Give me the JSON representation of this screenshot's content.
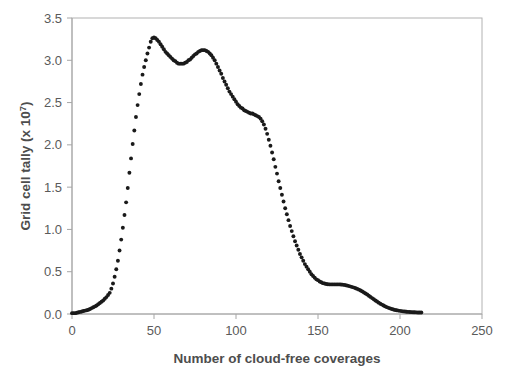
{
  "chart_data": {
    "type": "scatter",
    "title": "",
    "xlabel": "Number of cloud-free coverages",
    "ylabel": "Grid cell tally (x 10⁷)",
    "ylabel_base": "Grid cell tally (x 10",
    "ylabel_exp": "7",
    "ylabel_close": ")",
    "xlim": [
      0,
      250
    ],
    "ylim": [
      0.0,
      3.5
    ],
    "xticks": [
      0,
      50,
      100,
      150,
      200,
      250
    ],
    "xtick_labels": [
      "0",
      "50",
      "100",
      "150",
      "200",
      "250"
    ],
    "yticks": [
      0.0,
      0.5,
      1.0,
      1.5,
      2.0,
      2.5,
      3.0,
      3.5
    ],
    "ytick_labels": [
      "0.0",
      "0.5",
      "1.0",
      "1.5",
      "2.0",
      "2.5",
      "3.0",
      "3.5"
    ],
    "grid": false,
    "legend": "none",
    "marker": "circle",
    "marker_color": "#1a1a1a",
    "marker_size_px": 3.0,
    "plot_border_color": "#b0b0b0",
    "axis_color": "#a6a6a6",
    "tick_label_color": "#5a5a5a",
    "axis_title_color": "#4d4d4d",
    "x": [
      0,
      1,
      2,
      3,
      4,
      5,
      6,
      7,
      8,
      9,
      10,
      11,
      12,
      13,
      14,
      15,
      16,
      17,
      18,
      19,
      20,
      21,
      22,
      23,
      24,
      25,
      26,
      27,
      28,
      29,
      30,
      31,
      32,
      33,
      34,
      35,
      36,
      37,
      38,
      39,
      40,
      41,
      42,
      43,
      44,
      45,
      46,
      47,
      48,
      49,
      50,
      51,
      52,
      53,
      54,
      55,
      56,
      57,
      58,
      59,
      60,
      61,
      62,
      63,
      64,
      65,
      66,
      67,
      68,
      69,
      70,
      71,
      72,
      73,
      74,
      75,
      76,
      77,
      78,
      79,
      80,
      81,
      82,
      83,
      84,
      85,
      86,
      87,
      88,
      89,
      90,
      91,
      92,
      93,
      94,
      95,
      96,
      97,
      98,
      99,
      100,
      101,
      102,
      103,
      104,
      105,
      106,
      107,
      108,
      109,
      110,
      111,
      112,
      113,
      114,
      115,
      116,
      117,
      118,
      119,
      120,
      121,
      122,
      123,
      124,
      125,
      126,
      127,
      128,
      129,
      130,
      131,
      132,
      133,
      134,
      135,
      136,
      137,
      138,
      139,
      140,
      141,
      142,
      143,
      144,
      145,
      146,
      147,
      148,
      149,
      150,
      151,
      152,
      153,
      154,
      155,
      156,
      157,
      158,
      159,
      160,
      161,
      162,
      163,
      164,
      165,
      166,
      167,
      168,
      169,
      170,
      171,
      172,
      173,
      174,
      175,
      176,
      177,
      178,
      179,
      180,
      181,
      182,
      183,
      184,
      185,
      186,
      187,
      188,
      189,
      190,
      191,
      192,
      193,
      194,
      195,
      196,
      197,
      198,
      199,
      200,
      201,
      202,
      203,
      204,
      205,
      206,
      207,
      208,
      209,
      210,
      211,
      212,
      213
    ],
    "y": [
      0.01,
      0.01,
      0.01,
      0.015,
      0.02,
      0.025,
      0.03,
      0.035,
      0.04,
      0.045,
      0.05,
      0.06,
      0.07,
      0.08,
      0.09,
      0.1,
      0.115,
      0.13,
      0.145,
      0.16,
      0.18,
      0.2,
      0.225,
      0.25,
      0.3,
      0.36,
      0.44,
      0.53,
      0.63,
      0.75,
      0.88,
      1.02,
      1.17,
      1.32,
      1.49,
      1.67,
      1.84,
      2.01,
      2.17,
      2.33,
      2.47,
      2.6,
      2.72,
      2.83,
      2.92,
      3.0,
      3.08,
      3.15,
      3.22,
      3.26,
      3.27,
      3.26,
      3.24,
      3.22,
      3.19,
      3.16,
      3.13,
      3.1,
      3.08,
      3.06,
      3.04,
      3.02,
      3.0,
      2.99,
      2.97,
      2.96,
      2.96,
      2.96,
      2.96,
      2.97,
      2.98,
      3.0,
      3.01,
      3.03,
      3.05,
      3.07,
      3.08,
      3.1,
      3.11,
      3.12,
      3.12,
      3.12,
      3.11,
      3.1,
      3.08,
      3.06,
      3.03,
      3.0,
      2.96,
      2.92,
      2.88,
      2.84,
      2.79,
      2.75,
      2.71,
      2.67,
      2.63,
      2.6,
      2.57,
      2.54,
      2.51,
      2.48,
      2.46,
      2.44,
      2.43,
      2.41,
      2.4,
      2.39,
      2.38,
      2.37,
      2.37,
      2.36,
      2.35,
      2.34,
      2.33,
      2.31,
      2.28,
      2.24,
      2.19,
      2.13,
      2.06,
      1.99,
      1.91,
      1.83,
      1.74,
      1.66,
      1.57,
      1.49,
      1.41,
      1.33,
      1.25,
      1.18,
      1.11,
      1.04,
      0.98,
      0.92,
      0.86,
      0.81,
      0.76,
      0.71,
      0.67,
      0.63,
      0.59,
      0.56,
      0.53,
      0.5,
      0.47,
      0.45,
      0.43,
      0.41,
      0.4,
      0.385,
      0.375,
      0.365,
      0.36,
      0.355,
      0.352,
      0.35,
      0.35,
      0.35,
      0.35,
      0.35,
      0.35,
      0.35,
      0.349,
      0.347,
      0.344,
      0.34,
      0.335,
      0.33,
      0.324,
      0.318,
      0.312,
      0.305,
      0.297,
      0.288,
      0.278,
      0.267,
      0.255,
      0.243,
      0.23,
      0.216,
      0.202,
      0.188,
      0.174,
      0.16,
      0.147,
      0.134,
      0.122,
      0.111,
      0.1,
      0.09,
      0.081,
      0.073,
      0.066,
      0.059,
      0.053,
      0.048,
      0.044,
      0.04,
      0.037,
      0.034,
      0.031,
      0.029,
      0.027,
      0.025,
      0.023,
      0.022,
      0.021,
      0.02,
      0.019,
      0.018,
      0.017,
      0.017,
      0.016
    ]
  }
}
